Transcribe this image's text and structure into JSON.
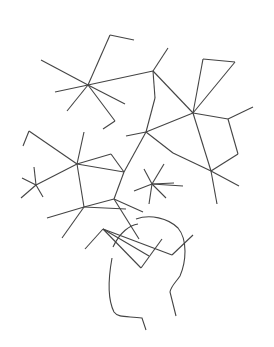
{
  "illustration": {
    "subject": "molecular-network-over-hand",
    "colors": {
      "stroke": "#444444",
      "hub_fill": "#e9e9e9",
      "leaf_fill": "#ffffff",
      "background": "#ffffff"
    },
    "nodes": [
      {
        "x": 88,
        "y": 85,
        "r": 26,
        "hub": true
      },
      {
        "x": 110,
        "y": 35,
        "r": 11
      },
      {
        "x": 134,
        "y": 40,
        "r": 4
      },
      {
        "x": 41,
        "y": 60,
        "r": 9
      },
      {
        "x": 55,
        "y": 92,
        "r": 4
      },
      {
        "x": 67,
        "y": 111,
        "r": 12
      },
      {
        "x": 125,
        "y": 104,
        "r": 4
      },
      {
        "x": 115,
        "y": 121,
        "r": 6
      },
      {
        "x": 103,
        "y": 129,
        "r": 2
      },
      {
        "x": 153,
        "y": 71,
        "r": 9
      },
      {
        "x": 168,
        "y": 48,
        "r": 4
      },
      {
        "x": 155,
        "y": 98,
        "r": 5
      },
      {
        "x": 146,
        "y": 132,
        "r": 13,
        "hub": true
      },
      {
        "x": 126,
        "y": 136,
        "r": 4
      },
      {
        "x": 193,
        "y": 113,
        "r": 15,
        "hub": true
      },
      {
        "x": 203,
        "y": 59,
        "r": 4
      },
      {
        "x": 235,
        "y": 62,
        "r": 8
      },
      {
        "x": 228,
        "y": 119,
        "r": 9
      },
      {
        "x": 253,
        "y": 107,
        "r": 4
      },
      {
        "x": 173,
        "y": 153,
        "r": 7
      },
      {
        "x": 238,
        "y": 154,
        "r": 7
      },
      {
        "x": 211,
        "y": 171,
        "r": 15,
        "hub": true
      },
      {
        "x": 239,
        "y": 186,
        "r": 7
      },
      {
        "x": 217,
        "y": 204,
        "r": 6
      },
      {
        "x": 77,
        "y": 164,
        "r": 22,
        "hub": true
      },
      {
        "x": 84,
        "y": 132,
        "r": 6
      },
      {
        "x": 111,
        "y": 154,
        "r": 5
      },
      {
        "x": 29,
        "y": 131,
        "r": 6
      },
      {
        "x": 23,
        "y": 146,
        "r": 4
      },
      {
        "x": 124,
        "y": 172,
        "r": 8
      },
      {
        "x": 36,
        "y": 185,
        "r": 8
      },
      {
        "x": 34,
        "y": 167,
        "r": 3
      },
      {
        "x": 22,
        "y": 178,
        "r": 2
      },
      {
        "x": 21,
        "y": 198,
        "r": 4
      },
      {
        "x": 43,
        "y": 197,
        "r": 3
      },
      {
        "x": 152,
        "y": 184,
        "r": 9,
        "hub": true
      },
      {
        "x": 144,
        "y": 169,
        "r": 3
      },
      {
        "x": 164,
        "y": 164,
        "r": 3
      },
      {
        "x": 174,
        "y": 183,
        "r": 3
      },
      {
        "x": 183,
        "y": 186,
        "r": 5
      },
      {
        "x": 134,
        "y": 191,
        "r": 4
      },
      {
        "x": 149,
        "y": 204,
        "r": 4
      },
      {
        "x": 166,
        "y": 198,
        "r": 3
      },
      {
        "x": 68,
        "y": 217,
        "r": 10
      },
      {
        "x": 84,
        "y": 207,
        "r": 4
      },
      {
        "x": 47,
        "y": 218,
        "r": 3
      },
      {
        "x": 62,
        "y": 238,
        "r": 4
      },
      {
        "x": 126,
        "y": 209,
        "r": 8
      },
      {
        "x": 114,
        "y": 199,
        "r": 3
      },
      {
        "x": 143,
        "y": 212,
        "r": 3
      },
      {
        "x": 139,
        "y": 239,
        "r": 14,
        "hub": true
      },
      {
        "x": 103,
        "y": 229,
        "r": 4
      },
      {
        "x": 85,
        "y": 249,
        "r": 8
      },
      {
        "x": 149,
        "y": 256,
        "r": 6
      },
      {
        "x": 141,
        "y": 268,
        "r": 3
      },
      {
        "x": 162,
        "y": 239,
        "r": 7
      },
      {
        "x": 172,
        "y": 255,
        "r": 4
      },
      {
        "x": 193,
        "y": 235,
        "r": 6
      }
    ],
    "edges": [
      [
        0,
        1
      ],
      [
        1,
        2
      ],
      [
        0,
        3
      ],
      [
        0,
        4
      ],
      [
        0,
        5
      ],
      [
        0,
        6
      ],
      [
        0,
        7
      ],
      [
        7,
        8
      ],
      [
        0,
        9
      ],
      [
        9,
        10
      ],
      [
        9,
        11
      ],
      [
        11,
        12
      ],
      [
        12,
        13
      ],
      [
        9,
        14
      ],
      [
        14,
        15
      ],
      [
        14,
        16
      ],
      [
        15,
        16
      ],
      [
        14,
        17
      ],
      [
        17,
        18
      ],
      [
        17,
        20
      ],
      [
        14,
        12
      ],
      [
        12,
        19
      ],
      [
        19,
        21
      ],
      [
        14,
        21
      ],
      [
        21,
        20
      ],
      [
        21,
        22
      ],
      [
        21,
        23
      ],
      [
        24,
        25
      ],
      [
        24,
        26
      ],
      [
        24,
        27
      ],
      [
        27,
        28
      ],
      [
        24,
        29
      ],
      [
        24,
        30
      ],
      [
        30,
        31
      ],
      [
        30,
        32
      ],
      [
        30,
        33
      ],
      [
        30,
        34
      ],
      [
        29,
        26
      ],
      [
        24,
        44
      ],
      [
        35,
        36
      ],
      [
        35,
        37
      ],
      [
        35,
        38
      ],
      [
        35,
        39
      ],
      [
        35,
        40
      ],
      [
        35,
        41
      ],
      [
        35,
        42
      ],
      [
        44,
        45
      ],
      [
        44,
        46
      ],
      [
        44,
        47
      ],
      [
        44,
        48
      ],
      [
        48,
        29
      ],
      [
        48,
        49
      ],
      [
        48,
        50
      ],
      [
        12,
        29
      ],
      [
        51,
        52
      ],
      [
        51,
        53
      ],
      [
        51,
        54
      ],
      [
        54,
        55
      ],
      [
        51,
        56
      ],
      [
        56,
        57
      ],
      [
        56,
        58
      ],
      [
        56,
        21
      ],
      [
        35,
        56
      ],
      [
        48,
        51
      ]
    ],
    "hand_paths": [
      "M112 258 C108 280 108 300 114 312 C118 318 128 316 142 318 L146 330",
      "M113 247 C120 232 130 225 138 224",
      "M136 219 C150 214 168 218 178 228 C188 240 186 262 180 276 C176 282 171 286 170 292 L176 316"
    ]
  }
}
